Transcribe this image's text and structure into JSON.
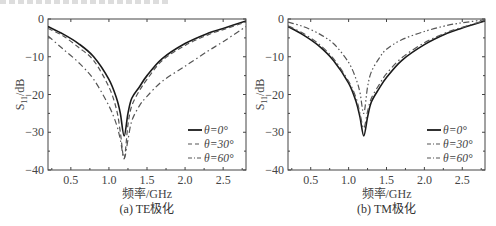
{
  "chart_data": [
    {
      "type": "line",
      "title": "(a) TE极化",
      "xlabel": "频率/GHz",
      "ylabel": "S11/dB",
      "xlim": [
        0.2,
        2.8
      ],
      "ylim": [
        -40,
        0
      ],
      "xticks": [
        "0.5",
        "1.0",
        "1.5",
        "2.0",
        "2.5"
      ],
      "yticks": [
        "0",
        "−10",
        "−20",
        "−30",
        "−40"
      ],
      "grid": false,
      "legend_position": "lower right",
      "x": [
        0.2,
        0.4,
        0.6,
        0.8,
        1.0,
        1.1,
        1.15,
        1.2,
        1.25,
        1.3,
        1.4,
        1.5,
        1.7,
        2.0,
        2.3,
        2.5,
        2.8
      ],
      "series": [
        {
          "name": "θ=0°",
          "style": "solid",
          "values": [
            -2,
            -4,
            -6.5,
            -10,
            -16,
            -21,
            -25,
            -31,
            -25,
            -21,
            -18,
            -15,
            -10.5,
            -6.5,
            -3.8,
            -2.5,
            -0.5
          ]
        },
        {
          "name": "θ=30°",
          "style": "dashed",
          "values": [
            -2.5,
            -4.5,
            -7.5,
            -11,
            -18,
            -24,
            -30,
            -37,
            -28,
            -23,
            -19,
            -16,
            -11,
            -7,
            -4.2,
            -2.8,
            -0.8
          ]
        },
        {
          "name": "θ=60°",
          "style": "dashdot",
          "values": [
            -4.5,
            -8,
            -11.5,
            -16,
            -23,
            -28,
            -32,
            -37,
            -32,
            -27,
            -23,
            -20.5,
            -16.5,
            -12.5,
            -8.5,
            -6,
            -2
          ]
        }
      ]
    },
    {
      "type": "line",
      "title": "(b) TM极化",
      "xlabel": "频率/GHz",
      "ylabel": "S11/dB",
      "xlim": [
        0.2,
        2.8
      ],
      "ylim": [
        -40,
        0
      ],
      "xticks": [
        "0.5",
        "1.0",
        "1.5",
        "2.0",
        "2.5"
      ],
      "yticks": [
        "0",
        "−10",
        "−20",
        "−30",
        "−40"
      ],
      "grid": false,
      "legend_position": "lower right",
      "x": [
        0.2,
        0.4,
        0.6,
        0.8,
        1.0,
        1.1,
        1.15,
        1.2,
        1.25,
        1.3,
        1.4,
        1.5,
        1.7,
        2.0,
        2.3,
        2.5,
        2.8
      ],
      "series": [
        {
          "name": "θ=0°",
          "style": "solid",
          "values": [
            -2,
            -4.2,
            -7,
            -11,
            -17,
            -22,
            -26,
            -31,
            -26,
            -22,
            -18.5,
            -15.5,
            -11,
            -6.8,
            -3.8,
            -2.4,
            -0.5
          ]
        },
        {
          "name": "θ=30°",
          "style": "dashdot",
          "values": [
            -1.8,
            -3.8,
            -6.5,
            -10.5,
            -16.5,
            -21,
            -25,
            -29,
            -24.5,
            -21,
            -17.5,
            -14.5,
            -10.3,
            -6.3,
            -3.5,
            -2.2,
            -0.4
          ]
        },
        {
          "name": "θ=60°",
          "style": "dashdot2",
          "values": [
            -0.8,
            -2,
            -3.8,
            -6.5,
            -11.5,
            -16,
            -19.5,
            -25,
            -18,
            -14,
            -10.5,
            -8,
            -5.5,
            -3.3,
            -1.7,
            -1.0,
            -0.2
          ]
        }
      ]
    }
  ],
  "panels": [
    {
      "caption": "(a) TE极化",
      "xlabel": "频率/GHz",
      "ylabel": "S",
      "ylabel_sub": "11",
      "ylabel_unit": "/dB",
      "legend": [
        "θ=0°",
        "θ=30°",
        "θ=60°"
      ]
    },
    {
      "caption": "(b) TM极化",
      "xlabel": "频率/GHz",
      "ylabel": "S",
      "ylabel_sub": "11",
      "ylabel_unit": "/dB",
      "legend": [
        "θ=0°",
        "θ=30°",
        "θ=60°"
      ]
    }
  ],
  "colors": {
    "solid": "#1a1a1a",
    "dashed": "#555555",
    "dashdot": "#555555",
    "axis": "#444444"
  }
}
